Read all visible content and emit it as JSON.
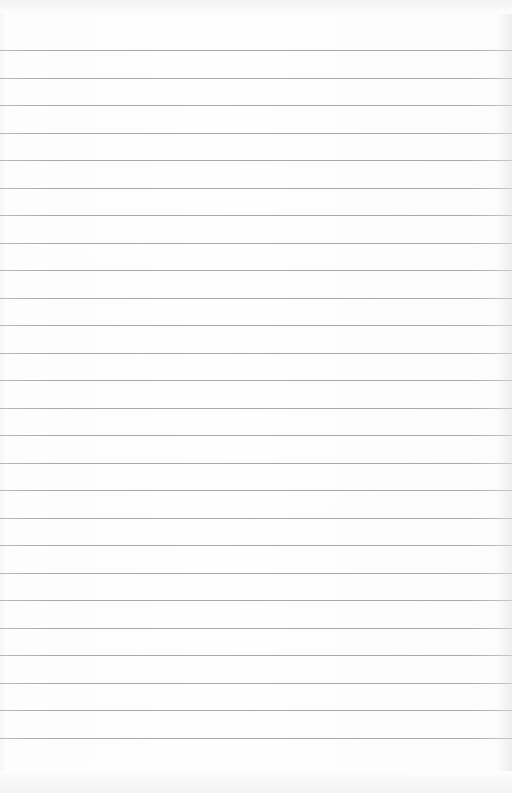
{
  "page": {
    "kind": "blank lined paper",
    "background_color": "#fdfdfd",
    "rule_color": "#a6a6a6",
    "rules": {
      "count": 26,
      "first_y": 50,
      "last_y": 738,
      "spacing": 27.52
    }
  }
}
